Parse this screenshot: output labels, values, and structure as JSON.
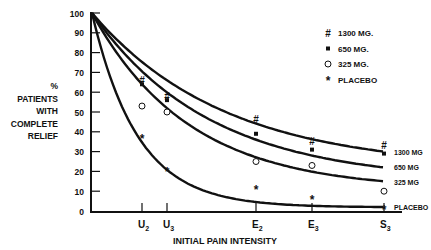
{
  "chart_data": {
    "type": "line",
    "title": "",
    "xlabel": "INITIAL PAIN INTENSITY",
    "ylabel": "% PATIENTS WITH COMPLETE RELIEF",
    "ylabel_lines": [
      "%",
      "PATIENTS",
      "WITH",
      "COMPLETE",
      "RELIEF"
    ],
    "ylim": [
      0,
      100
    ],
    "yticks": [
      0,
      10,
      20,
      30,
      40,
      50,
      60,
      70,
      80,
      90,
      100
    ],
    "categories": [
      "U2",
      "U3",
      "E2",
      "E3",
      "S3"
    ],
    "xtick_labels": [
      {
        "main": "U",
        "sub": "2"
      },
      {
        "main": "U",
        "sub": "3"
      },
      {
        "main": "E",
        "sub": "2"
      },
      {
        "main": "E",
        "sub": "3"
      },
      {
        "main": "S",
        "sub": "3"
      }
    ],
    "grid": false,
    "legend_position": "top-right",
    "series": [
      {
        "name": "1300 MG.",
        "curve_label": "1300 MG",
        "marker": "hash",
        "values": [
          66,
          58,
          46,
          35,
          33
        ]
      },
      {
        "name": "650 MG.",
        "curve_label": "650 MG",
        "marker": "square",
        "values": [
          64,
          56,
          39,
          31,
          29
        ]
      },
      {
        "name": "325 MG.",
        "curve_label": "325 MG",
        "marker": "circle",
        "values": [
          53,
          50,
          25,
          23,
          10
        ]
      },
      {
        "name": "PLACEBO",
        "curve_label": "PLACEBO",
        "marker": "asterisk",
        "values": [
          37,
          20,
          11,
          6,
          1
        ]
      }
    ]
  }
}
